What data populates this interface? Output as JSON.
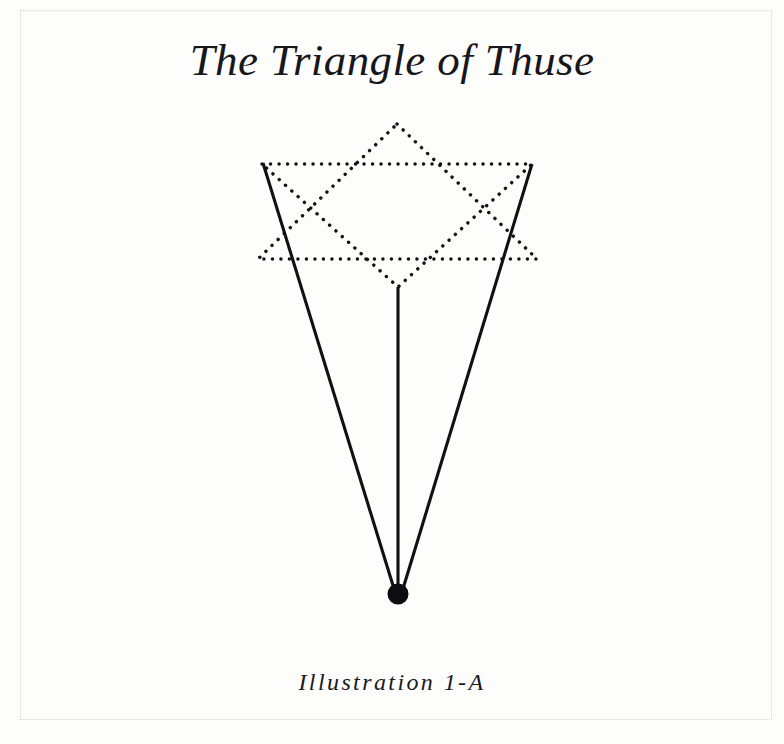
{
  "figure": {
    "title": "The Triangle of Thuse",
    "caption": "Illustration 1-A",
    "ink_color": "#121116",
    "paper_color": "#fdfdfc",
    "border_color": "#d8d6d4"
  },
  "diagram": {
    "type": "geometric-figure",
    "canvas": {
      "width": 784,
      "height": 744
    },
    "elements": [
      {
        "name": "upward-triangle-dotted",
        "style": "dotted",
        "points": "397,124 537,259 258,259",
        "vertices": [
          {
            "label": "apex",
            "x": 397,
            "y": 124
          },
          {
            "label": "base-right",
            "x": 537,
            "y": 259
          },
          {
            "label": "base-left",
            "x": 258,
            "y": 259
          }
        ]
      },
      {
        "name": "downward-triangle-dotted",
        "style": "dotted",
        "points": "262,164 532,164 398,287",
        "vertices": [
          {
            "label": "top-left",
            "x": 262,
            "y": 164
          },
          {
            "label": "top-right",
            "x": 532,
            "y": 164
          },
          {
            "label": "apex",
            "x": 398,
            "y": 287
          }
        ]
      },
      {
        "name": "left-solid-ray",
        "style": "solid",
        "from": {
          "x": 263,
          "y": 163
        },
        "to": {
          "x": 395,
          "y": 592
        }
      },
      {
        "name": "right-solid-ray",
        "style": "solid",
        "from": {
          "x": 532,
          "y": 164
        },
        "to": {
          "x": 402,
          "y": 592
        }
      },
      {
        "name": "central-vertical-line",
        "style": "solid",
        "from": {
          "x": 398,
          "y": 287
        },
        "to": {
          "x": 398,
          "y": 592
        }
      },
      {
        "name": "apex-node-dot",
        "style": "filled-circle",
        "center": {
          "x": 398,
          "y": 594
        },
        "radius": 10.5
      }
    ]
  }
}
